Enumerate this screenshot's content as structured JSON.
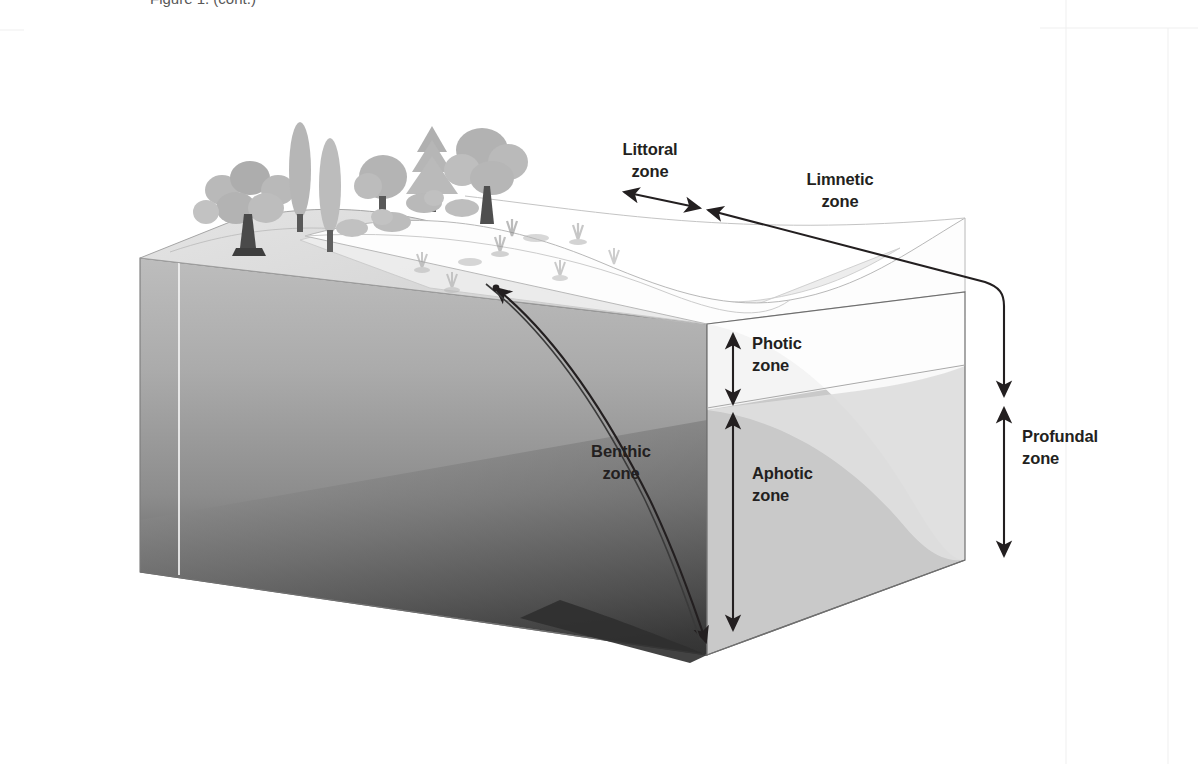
{
  "figure": {
    "title_fragment": "Figure 1. (cont.)",
    "background_color": "#ffffff",
    "label_color": "#231f20",
    "width": 1198,
    "height": 764
  },
  "labels": {
    "littoral": "Littoral\nzone",
    "limnetic": "Limnetic\nzone",
    "photic": "Photic\nzone",
    "aphotic": "Aphotic\nzone",
    "benthic": "Benthic\nzone",
    "profundal": "Profundal\nzone"
  },
  "diagram": {
    "zones": [
      {
        "key": "littoral",
        "label": "Littoral zone",
        "measure": "horizontal-double-arrow",
        "region": "shallow near-shore water"
      },
      {
        "key": "limnetic",
        "label": "Limnetic zone",
        "measure": "horizontal-double-arrow",
        "region": "open surface water"
      },
      {
        "key": "photic",
        "label": "Photic zone",
        "measure": "vertical-double-arrow",
        "region": "sunlit upper water layer"
      },
      {
        "key": "aphotic",
        "label": "Aphotic zone",
        "measure": "vertical-double-arrow",
        "region": "dark deep water layer"
      },
      {
        "key": "benthic",
        "label": "Benthic zone",
        "measure": "curved-double-arrow",
        "region": "lake bottom sediment surface"
      },
      {
        "key": "profundal",
        "label": "Profundal zone",
        "measure": "vertical-double-arrow",
        "region": "deep water below limnetic"
      }
    ],
    "colors": {
      "water_surface": "#ffffff",
      "littoral_surface": "#ececec",
      "photic_face": "#f1f1f1",
      "aphotic_face": "#c8c8c8",
      "benthic_slope_face": "#d9d9d9",
      "deep_left_face_top": "#b6b6b6",
      "deep_left_face_bottom": "#3b3b3b",
      "shore_land": "#dcdcdc",
      "vegetation": "#b9b9b9",
      "outline": "#5a5a5a",
      "arrow": "#231f20",
      "frame_guide": "#eeeeee"
    },
    "vegetation": {
      "trees": [
        "broadleaf-tree",
        "poplar-tree",
        "poplar-tree",
        "round-tree",
        "conifer-tree",
        "large-oak-tree"
      ],
      "shrubs": [
        "shrub",
        "shrub",
        "shrub",
        "shrub"
      ],
      "aquatic_plants": [
        "reed-cluster",
        "reed-cluster",
        "reed-cluster",
        "lily-pad",
        "lily-pad",
        "reed-cluster",
        "reed-cluster",
        "reed-cluster"
      ]
    }
  }
}
